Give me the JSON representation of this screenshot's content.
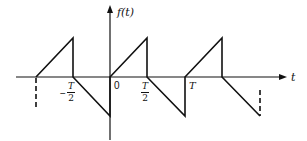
{
  "diagram": {
    "y_axis_label": "f(t)",
    "x_axis_label": "t",
    "tick_labels": {
      "origin": "0",
      "neg_half_period": {
        "sign": "−",
        "numerator": "T",
        "denominator": "2"
      },
      "half_period": {
        "numerator": "T",
        "denominator": "2"
      },
      "period": "T"
    },
    "waveform": "periodic sawtooth: ramp up from 0 to peak over [nT, nT+T/2], drop to 0, ramp down to negative peak over [nT+T/2, (n+1)T], jump to 0",
    "line_color": "#111111",
    "background": "#ffffff"
  }
}
